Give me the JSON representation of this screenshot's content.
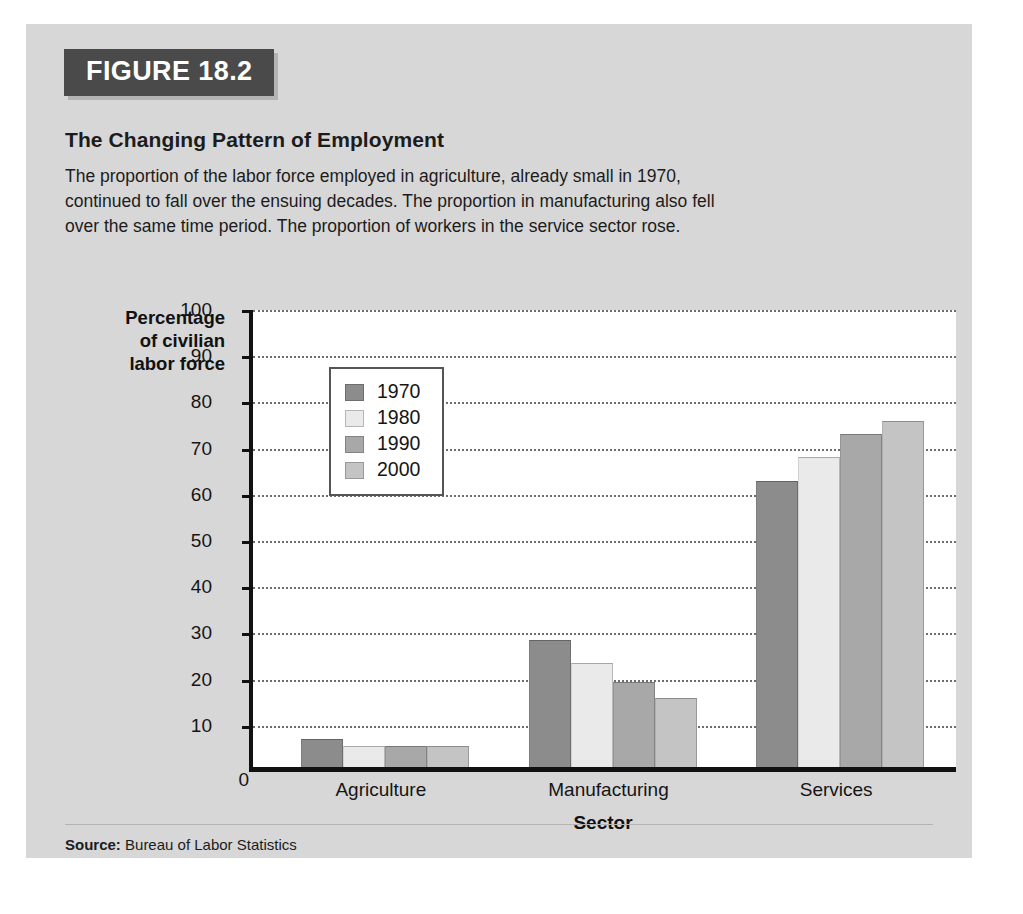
{
  "figure": {
    "tag": "FIGURE 18.2",
    "heading": "The Changing Pattern of Employment",
    "description": "The proportion of the labor force employed in agriculture, already small in 1970, continued to fall over the ensuing decades. The proportion in manufacturing also fell over the same time period. The proportion of workers in the service sector rose.",
    "source_label": "Source:",
    "source_text": "Bureau of Labor Statistics"
  },
  "chart_data": {
    "type": "bar",
    "title": "The Changing Pattern of Employment",
    "categories": [
      "Agriculture",
      "Manufacturing",
      "Services"
    ],
    "series": [
      {
        "name": "1970",
        "color": "#8c8c8c",
        "values": [
          6,
          27.5,
          62
        ]
      },
      {
        "name": "1980",
        "color": "#eaeaea",
        "values": [
          4.5,
          22.5,
          67
        ]
      },
      {
        "name": "1990",
        "color": "#a8a8a8",
        "values": [
          4.5,
          18.5,
          72
        ]
      },
      {
        "name": "2000",
        "color": "#c4c4c4",
        "values": [
          4.5,
          15,
          75
        ]
      }
    ],
    "xlabel": "Sector",
    "ylabel": "Percentage of civilian labor force",
    "ylabel_lines": [
      "Percentage",
      "of civilian",
      "labor force"
    ],
    "ylim": [
      0,
      100
    ],
    "ytick_step": 10,
    "yticks": [
      0,
      10,
      20,
      30,
      40,
      50,
      60,
      70,
      80,
      90,
      100
    ],
    "grid": true,
    "legend_position": "upper-left-inside"
  }
}
